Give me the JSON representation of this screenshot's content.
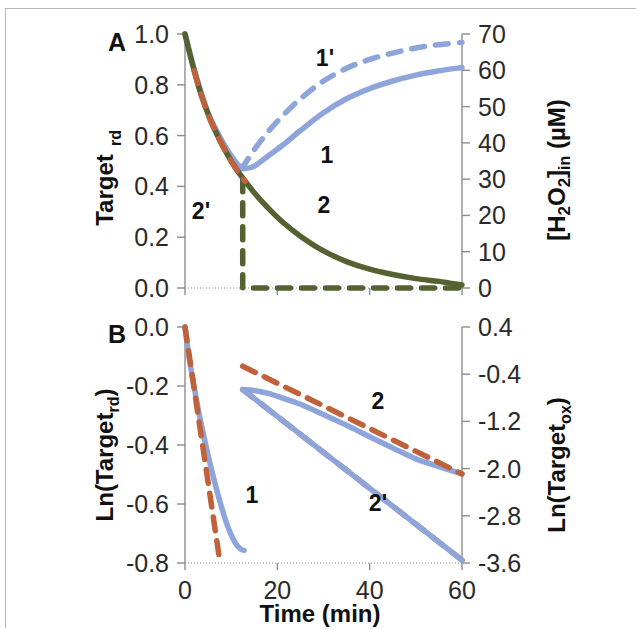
{
  "figure": {
    "panels": [
      {
        "id": "A",
        "letter": "A",
        "left_axis_title": "Target",
        "left_axis_title_sub": "rd",
        "right_axis_title_main": "[H",
        "right_axis_title": "[H2O2]in  (μM)",
        "left_ticks": [
          "1.0",
          "0.8",
          "0.6",
          "0.4",
          "0.2",
          "0.0"
        ],
        "right_ticks": [
          "70",
          "60",
          "50",
          "40",
          "30",
          "20",
          "10",
          "0"
        ],
        "curve_labels": [
          {
            "text": "1'",
            "x": 325,
            "y": 66
          },
          {
            "text": "1",
            "x": 327,
            "y": 163
          },
          {
            "text": "2",
            "x": 324,
            "y": 213
          },
          {
            "text": "2'",
            "x": 201,
            "y": 219
          }
        ]
      },
      {
        "id": "B",
        "letter": "B",
        "left_axis_title": "Ln(Target",
        "left_axis_title_sub": "rd",
        "left_axis_title_close": ")",
        "right_axis_title": "Ln(Target",
        "right_axis_title_sub": "ox",
        "right_axis_title_close": ")",
        "left_ticks": [
          "0.0",
          "-0.2",
          "-0.4",
          "-0.6",
          "-0.8"
        ],
        "right_ticks": [
          "0.4",
          "-0.4",
          "-1.2",
          "-2.0",
          "-2.8",
          "-3.6"
        ],
        "x_ticks": [
          "0",
          "20",
          "40",
          "60"
        ],
        "x_axis_title": "Time (min)",
        "curve_labels": [
          {
            "text": "1",
            "x": 252,
            "y": 503
          },
          {
            "text": "2",
            "x": 378,
            "y": 409
          },
          {
            "text": "2'",
            "x": 378,
            "y": 511
          }
        ]
      }
    ]
  },
  "colors": {
    "blue": "#8ea5dc",
    "green": "#566132",
    "orange": "#c0613a",
    "axis": "#8d8d8d",
    "text": "#1b1b1b",
    "frame": "#b9b9b9",
    "background": "#ffffff"
  },
  "chart_data": [
    {
      "type": "line",
      "panel": "A",
      "title": "",
      "xlabel": "Time (min)",
      "ylabel": "Target_rd",
      "y2label": "[H2O2]in (μM)",
      "xlim": [
        0,
        60
      ],
      "ylim": [
        0.0,
        1.0
      ],
      "y2lim": [
        0,
        70
      ],
      "grid": false,
      "xticks": [
        0,
        20,
        40,
        60
      ],
      "yticks": [
        0.0,
        0.2,
        0.4,
        0.6,
        0.8,
        1.0
      ],
      "y2ticks": [
        0,
        10,
        20,
        30,
        40,
        50,
        60,
        70
      ],
      "series": [
        {
          "name": "1",
          "label": "1",
          "axis": "left",
          "style": "solid",
          "color": "#8ea5dc",
          "x": [
            0,
            1,
            2,
            3,
            4,
            5,
            6,
            8,
            10,
            12,
            13,
            15,
            18,
            21,
            25,
            30,
            35,
            40,
            45,
            50,
            55,
            60
          ],
          "y": [
            1.0,
            0.93,
            0.86,
            0.8,
            0.74,
            0.69,
            0.65,
            0.58,
            0.52,
            0.475,
            0.47,
            0.48,
            0.52,
            0.56,
            0.62,
            0.69,
            0.745,
            0.785,
            0.815,
            0.838,
            0.855,
            0.868
          ]
        },
        {
          "name": "1prime",
          "label": "1'",
          "axis": "left",
          "style": "dashed",
          "color": "#8ea5dc",
          "x": [
            12,
            13,
            15,
            18,
            21,
            25,
            30,
            35,
            40,
            45,
            50,
            55,
            60
          ],
          "y": [
            0.47,
            0.49,
            0.545,
            0.615,
            0.675,
            0.745,
            0.815,
            0.865,
            0.9,
            0.925,
            0.945,
            0.958,
            0.967
          ]
        },
        {
          "name": "2",
          "label": "2",
          "axis": "left",
          "style": "solid",
          "color": "#566132",
          "x": [
            0,
            1,
            2,
            3,
            4,
            5,
            6,
            8,
            10,
            12,
            15,
            18,
            21,
            25,
            30,
            35,
            40,
            45,
            50,
            55,
            60
          ],
          "y": [
            1.0,
            0.925,
            0.855,
            0.79,
            0.735,
            0.685,
            0.64,
            0.565,
            0.5,
            0.445,
            0.375,
            0.315,
            0.262,
            0.204,
            0.146,
            0.104,
            0.074,
            0.053,
            0.037,
            0.026,
            0.012
          ]
        },
        {
          "name": "2prime",
          "label": "2'",
          "axis": "left",
          "style": "dashed",
          "color": "#566132",
          "x": [
            12.5,
            12.5,
            15,
            20,
            25,
            30,
            35,
            40,
            45,
            50,
            55,
            60
          ],
          "y": [
            0.43,
            0.0,
            0.0,
            0.0,
            0.0,
            0.0,
            0.0,
            0.0,
            0.0,
            0.0,
            0.0,
            0.0
          ]
        },
        {
          "name": "1_overlay_fit",
          "label": "",
          "axis": "left",
          "style": "dashed",
          "color": "#c0613a",
          "x": [
            2,
            3,
            4,
            5,
            6,
            8,
            10,
            12,
            13
          ],
          "y": [
            0.855,
            0.79,
            0.735,
            0.685,
            0.64,
            0.565,
            0.5,
            0.445,
            0.42
          ]
        }
      ]
    },
    {
      "type": "line",
      "panel": "B",
      "title": "",
      "xlabel": "Time (min)",
      "ylabel": "Ln(Target_rd)",
      "y2label": "Ln(Target_ox)",
      "xlim": [
        0,
        60
      ],
      "ylim": [
        -0.8,
        0.0
      ],
      "y2lim": [
        -3.6,
        0.4
      ],
      "grid": false,
      "xticks": [
        0,
        20,
        40,
        60
      ],
      "yticks": [
        -0.8,
        -0.6,
        -0.4,
        -0.2,
        0.0
      ],
      "y2ticks": [
        -3.6,
        -2.8,
        -2.0,
        -1.2,
        -0.4,
        0.4
      ],
      "series": [
        {
          "name": "1",
          "label": "1",
          "axis": "left",
          "style": "solid",
          "color": "#8ea5dc",
          "x": [
            0,
            0.5,
            1,
            2,
            3,
            4,
            5,
            6,
            7,
            8,
            9,
            10,
            11,
            12,
            12.8
          ],
          "y": [
            0.0,
            -0.06,
            -0.115,
            -0.205,
            -0.29,
            -0.365,
            -0.435,
            -0.5,
            -0.56,
            -0.615,
            -0.665,
            -0.705,
            -0.735,
            -0.752,
            -0.757
          ]
        },
        {
          "name": "1_fit",
          "label": "",
          "axis": "left",
          "style": "dashed",
          "color": "#c0613a",
          "x": [
            0,
            7.6
          ],
          "y": [
            0.0,
            -0.8
          ]
        },
        {
          "name": "2",
          "label": "2",
          "axis": "left",
          "style": "solid",
          "color": "#8ea5dc",
          "x": [
            12.5,
            15,
            18,
            21,
            25,
            30,
            35,
            40,
            45,
            50,
            55,
            60
          ],
          "y": [
            -0.212,
            -0.215,
            -0.225,
            -0.24,
            -0.262,
            -0.297,
            -0.333,
            -0.372,
            -0.41,
            -0.447,
            -0.473,
            -0.498
          ]
        },
        {
          "name": "2_fit",
          "label": "",
          "axis": "left",
          "style": "dashed",
          "color": "#c0613a",
          "x": [
            12.5,
            60
          ],
          "y": [
            -0.133,
            -0.498
          ]
        },
        {
          "name": "2prime",
          "label": "2'",
          "axis": "left",
          "style": "dashed",
          "color": "#c0613a",
          "x": [
            12.5,
            60
          ],
          "y": [
            -0.212,
            -0.79
          ]
        },
        {
          "name": "2prime_under",
          "label": "",
          "axis": "left",
          "style": "solid",
          "color": "#8ea5dc",
          "x": [
            12.5,
            60
          ],
          "y": [
            -0.212,
            -0.79
          ]
        }
      ]
    }
  ]
}
